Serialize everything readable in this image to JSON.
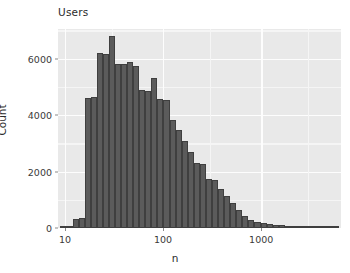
{
  "chart_data": {
    "type": "bar",
    "title": "Users",
    "subtitle": "",
    "xlabel": "n",
    "ylabel": "Count",
    "xscale": "log10",
    "yscale": "linear",
    "xlim": [
      8.5,
      6500
    ],
    "ylim": [
      0,
      7050
    ],
    "grid": true,
    "legend": null,
    "bar_color": "#5b5b5b",
    "bar_edge_color": "#3f3f3f",
    "panel_color": "#e9e9e9",
    "gridline_color": "#fdfdfd",
    "note": "Histogram of user post counts on a log10 x-axis; bin width = 0.1 decade groups rendered as ~0.1 log units",
    "x_tick_labels": [
      "10",
      "100",
      "1000"
    ],
    "x_tick_values": [
      10,
      100,
      1000
    ],
    "y_tick_labels": [
      "0",
      "2000",
      "4000",
      "6000"
    ],
    "y_tick_values": [
      0,
      2000,
      4000,
      6000
    ],
    "bins": [
      {
        "x_lo": 9.0,
        "x_hi": 10.4,
        "count": 20
      },
      {
        "x_lo": 10.4,
        "x_hi": 12.0,
        "count": 30
      },
      {
        "x_lo": 12.0,
        "x_hi": 13.8,
        "count": 330
      },
      {
        "x_lo": 13.8,
        "x_hi": 15.9,
        "count": 340
      },
      {
        "x_lo": 15.9,
        "x_hi": 18.3,
        "count": 4620
      },
      {
        "x_lo": 18.3,
        "x_hi": 21.1,
        "count": 4640
      },
      {
        "x_lo": 21.1,
        "x_hi": 24.4,
        "count": 6200
      },
      {
        "x_lo": 24.4,
        "x_hi": 28.1,
        "count": 6180
      },
      {
        "x_lo": 28.1,
        "x_hi": 32.4,
        "count": 6800
      },
      {
        "x_lo": 32.4,
        "x_hi": 37.3,
        "count": 5820
      },
      {
        "x_lo": 37.3,
        "x_hi": 43.0,
        "count": 5800
      },
      {
        "x_lo": 43.0,
        "x_hi": 49.6,
        "count": 5880
      },
      {
        "x_lo": 49.6,
        "x_hi": 57.2,
        "count": 5730
      },
      {
        "x_lo": 57.2,
        "x_hi": 65.9,
        "count": 4880
      },
      {
        "x_lo": 65.9,
        "x_hi": 76.0,
        "count": 4870
      },
      {
        "x_lo": 76.0,
        "x_hi": 87.6,
        "count": 5320
      },
      {
        "x_lo": 87.6,
        "x_hi": 101.0,
        "count": 4560
      },
      {
        "x_lo": 101.0,
        "x_hi": 116.4,
        "count": 4540
      },
      {
        "x_lo": 116.4,
        "x_hi": 134.2,
        "count": 3810
      },
      {
        "x_lo": 134.2,
        "x_hi": 154.8,
        "count": 3490
      },
      {
        "x_lo": 154.8,
        "x_hi": 178.4,
        "count": 3100
      },
      {
        "x_lo": 178.4,
        "x_hi": 205.7,
        "count": 2700
      },
      {
        "x_lo": 205.7,
        "x_hi": 237.1,
        "count": 2320
      },
      {
        "x_lo": 237.1,
        "x_hi": 273.4,
        "count": 2280
      },
      {
        "x_lo": 273.4,
        "x_hi": 315.2,
        "count": 1720
      },
      {
        "x_lo": 315.2,
        "x_hi": 363.4,
        "count": 1700
      },
      {
        "x_lo": 363.4,
        "x_hi": 419.0,
        "count": 1380
      },
      {
        "x_lo": 419.0,
        "x_hi": 483.0,
        "count": 1130
      },
      {
        "x_lo": 483.0,
        "x_hi": 556.9,
        "count": 880
      },
      {
        "x_lo": 556.9,
        "x_hi": 642.0,
        "count": 640
      },
      {
        "x_lo": 642.0,
        "x_hi": 740.1,
        "count": 430
      },
      {
        "x_lo": 740.1,
        "x_hi": 853.2,
        "count": 300
      },
      {
        "x_lo": 853.2,
        "x_hi": 983.7,
        "count": 230
      },
      {
        "x_lo": 983.7,
        "x_hi": 1134.0,
        "count": 180
      },
      {
        "x_lo": 1134.0,
        "x_hi": 1307.4,
        "count": 140
      },
      {
        "x_lo": 1307.4,
        "x_hi": 1507.3,
        "count": 110
      },
      {
        "x_lo": 1507.3,
        "x_hi": 1737.8,
        "count": 90
      },
      {
        "x_lo": 1737.8,
        "x_hi": 2003.4,
        "count": 70
      },
      {
        "x_lo": 2003.4,
        "x_hi": 2309.7,
        "count": 55
      },
      {
        "x_lo": 2309.7,
        "x_hi": 2662.9,
        "count": 45
      },
      {
        "x_lo": 2662.9,
        "x_hi": 3070.0,
        "count": 35
      },
      {
        "x_lo": 3070.0,
        "x_hi": 3539.4,
        "count": 28
      },
      {
        "x_lo": 3539.4,
        "x_hi": 4080.5,
        "count": 22
      },
      {
        "x_lo": 4080.5,
        "x_hi": 4704.3,
        "count": 18
      },
      {
        "x_lo": 4704.3,
        "x_hi": 5423.4,
        "count": 14
      },
      {
        "x_lo": 5423.4,
        "x_hi": 6252.6,
        "count": 10
      }
    ]
  }
}
